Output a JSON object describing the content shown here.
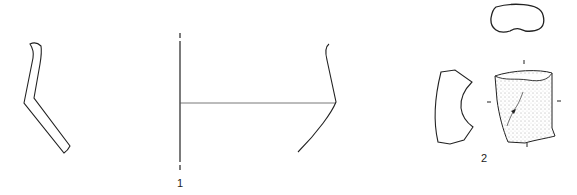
{
  "figure": {
    "labels": [
      {
        "id": "fig1",
        "text": "1"
      },
      {
        "id": "fig2",
        "text": "2"
      }
    ],
    "colors": {
      "line": "#222222",
      "stipple": "#555555",
      "background": "#ffffff"
    }
  }
}
